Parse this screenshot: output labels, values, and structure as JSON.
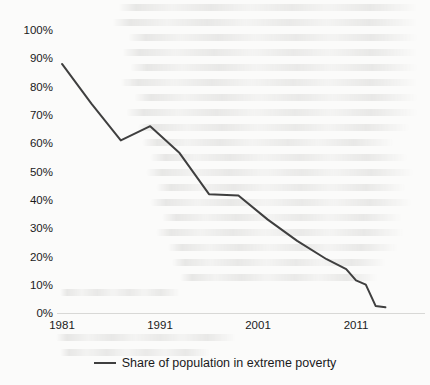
{
  "page": {
    "background_color": "#fbfbfa",
    "has_scan_bleedthrough": true
  },
  "chart_data": {
    "type": "line",
    "title": "",
    "xlabel": "",
    "ylabel": "",
    "xlim": [
      1981,
      2014
    ],
    "ylim": [
      0,
      1.0
    ],
    "grid": false,
    "legend_position": "bottom-center",
    "line_color": "#3f3f3f",
    "x_tick_labels": [
      "1981",
      "1991",
      "2001",
      "2011"
    ],
    "x_tick_values": [
      1981,
      1991,
      2001,
      2011
    ],
    "y_tick_labels": [
      "0%",
      "10%",
      "20%",
      "30%",
      "40%",
      "50%",
      "60%",
      "70%",
      "80%",
      "90%",
      "100%"
    ],
    "y_tick_values": [
      0,
      0.1,
      0.2,
      0.3,
      0.4,
      0.5,
      0.6,
      0.7,
      0.8,
      0.9,
      1.0
    ],
    "series": [
      {
        "name": "Share of population in extreme poverty",
        "x": [
          1981,
          1984,
          1987,
          1990,
          1993,
          1996,
          1999,
          2002,
          2005,
          2008,
          2010,
          2011,
          2012,
          2013,
          2014
        ],
        "values": [
          0.88,
          0.74,
          0.61,
          0.66,
          0.565,
          0.42,
          0.415,
          0.33,
          0.255,
          0.19,
          0.155,
          0.115,
          0.1,
          0.025,
          0.02
        ]
      }
    ]
  },
  "legend": {
    "entries": [
      {
        "label": "Share of population in extreme poverty",
        "color": "#3f3f3f"
      }
    ]
  }
}
